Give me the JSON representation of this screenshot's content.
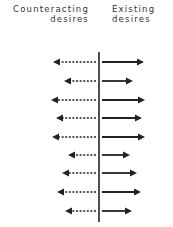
{
  "labels": {
    "left_line1": "Counteracting",
    "left_line2": "desires",
    "right_line1": "Existing",
    "right_line2": "desires"
  },
  "colors": {
    "ink": "#222222",
    "text": "#333333"
  },
  "diagram": {
    "center_x": 99,
    "axis_top": 52,
    "axis_bottom": 222,
    "rows": [
      {
        "y": 62,
        "left_tip": 53,
        "right_tip": 144
      },
      {
        "y": 81,
        "left_tip": 64,
        "right_tip": 133
      },
      {
        "y": 100,
        "left_tip": 51,
        "right_tip": 145
      },
      {
        "y": 118,
        "left_tip": 56,
        "right_tip": 142
      },
      {
        "y": 137,
        "left_tip": 52,
        "right_tip": 145
      },
      {
        "y": 155,
        "left_tip": 68,
        "right_tip": 130
      },
      {
        "y": 173,
        "left_tip": 62,
        "right_tip": 137
      },
      {
        "y": 192,
        "left_tip": 57,
        "right_tip": 141
      },
      {
        "y": 211,
        "left_tip": 65,
        "right_tip": 132
      }
    ]
  }
}
